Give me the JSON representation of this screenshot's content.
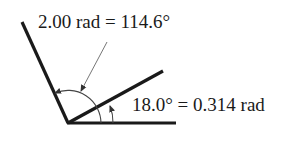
{
  "diagram": {
    "type": "angle-measurement",
    "labels": {
      "large_angle": "2.00 rad = 114.6°",
      "small_angle": "18.0° = 0.314 rad"
    },
    "angles": [
      {
        "name": "large",
        "radians": 2.0,
        "degrees": 114.6
      },
      {
        "name": "small",
        "radians": 0.314,
        "degrees": 18.0
      }
    ],
    "colors": {
      "rays": "#1a1a1a",
      "arcs": "#444444",
      "leader": "#666666",
      "background": "#ffffff"
    }
  }
}
